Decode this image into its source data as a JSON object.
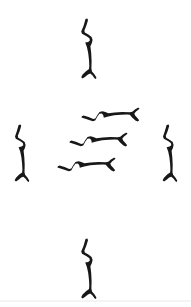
{
  "image": {
    "title": "Twig Stroke Arrangement",
    "width": 191,
    "height": 307,
    "background_color": "#ffffff",
    "ink_color": "#181818",
    "medium": "brush-ink-drawing",
    "description": "Seven forked twig-like brush strokes arranged in a cross pattern around three stacked horizontal strokes"
  },
  "figure": {
    "layout": "cross",
    "stroke_count": 7,
    "center_cluster_count": 3,
    "satellite_count": 4
  },
  "strokes": [
    {
      "name": "top-stroke",
      "orientation": "vertical",
      "position": "top",
      "x": 82,
      "y": 18,
      "length": 62,
      "path": "M 85.5 19 L 83.5 26 L 81.2 31.5 L 82.0 33.8 L 86.6 36.2 L 89.4 38.2 L 89.9 40.6 L 88.2 42.0 L 85.2 42.6 L 86.9 47.0 L 88.2 53.0 L 89.0 60.0 L 89.3 66.0 L 89.0 69.0 L 86.0 71.3 L 82.6 74.6 L 81.2 77.2 L 82.6 78.6 L 85.2 76.8 L 88.0 74.4 L 90.2 73.6 L 92.6 75.6 L 94.4 78.2 L 96.0 79.1 L 96.4 77.4 L 94.4 74.2 L 92.0 71.4 L 91.4 68.6 L 91.6 61.0 L 91.2 53.0 L 90.4 46.2 L 91.8 43.2 L 92.6 40.0 L 91.6 37.0 L 88.4 34.6 L 84.8 32.6 L 84.4 30.4 L 86.4 25.6 L 88.0 20.2 L 87.4 18.4 Z"
    },
    {
      "name": "left-stroke",
      "orientation": "vertical",
      "position": "left",
      "x": 13,
      "y": 124,
      "length": 58,
      "path": "M 18.6 125 L 16.8 131.2 L 15.0 136.4 L 15.8 138.8 L 20.0 141.0 L 22.8 143.0 L 23.3 145.2 L 21.6 146.6 L 18.6 147.2 L 20.2 151.4 L 21.4 157.2 L 22.1 163.8 L 22.4 169.6 L 22.1 172.4 L 19.2 174.6 L 16.0 177.8 L 14.6 180.2 L 16.0 181.6 L 18.6 179.8 L 21.2 177.6 L 23.3 176.8 L 25.6 178.8 L 27.4 181.2 L 28.9 182.0 L 29.2 180.4 L 27.4 177.4 L 25.1 174.8 L 24.5 172.2 L 24.7 164.8 L 24.3 157.2 L 23.6 150.8 L 24.9 147.9 L 25.6 144.9 L 24.7 142.0 L 21.6 139.7 L 18.2 137.8 L 17.8 135.7 L 19.7 131.1 L 21.2 126.0 L 20.6 124.4 Z"
    },
    {
      "name": "right-stroke",
      "orientation": "vertical",
      "position": "right",
      "x": 160,
      "y": 124,
      "length": 58,
      "path": "M 166.6 125 L 164.8 131.2 L 163.0 136.4 L 163.8 138.8 L 168.0 141.0 L 170.8 143.0 L 171.3 145.2 L 169.6 146.6 L 166.6 147.2 L 168.2 151.4 L 169.4 157.2 L 170.1 163.8 L 170.4 169.6 L 170.1 172.4 L 167.2 174.6 L 164.0 177.8 L 162.6 180.2 L 164.0 181.6 L 166.6 179.8 L 169.2 177.6 L 171.3 176.8 L 173.6 178.8 L 175.4 181.2 L 176.9 182.0 L 177.2 180.4 L 175.4 177.4 L 173.1 174.8 L 172.5 172.2 L 172.7 164.8 L 172.3 157.2 L 171.6 150.8 L 172.9 147.9 L 173.6 144.9 L 172.7 142.0 L 169.6 139.7 L 166.2 137.8 L 165.8 135.7 L 167.7 131.1 L 169.2 126.0 L 168.6 124.4 Z"
    },
    {
      "name": "bottom-stroke",
      "orientation": "vertical",
      "position": "bottom",
      "x": 82,
      "y": 238,
      "length": 60,
      "path": "M 85.5 239 L 83.5 246 L 81.2 251.5 L 82.0 253.8 L 86.6 256.2 L 89.4 258.2 L 89.9 260.6 L 88.2 262.0 L 85.2 262.6 L 86.9 267.0 L 88.2 273.0 L 89.0 280.0 L 89.3 286.0 L 89.0 289.0 L 86.0 291.3 L 82.6 294.6 L 81.2 297.2 L 82.6 298.6 L 85.2 296.8 L 88.0 294.4 L 90.2 293.6 L 92.6 295.6 L 94.4 298.2 L 96.0 299.1 L 96.4 297.4 L 94.4 294.2 L 92.0 291.4 L 91.4 288.6 L 91.6 281.0 L 91.2 273.0 L 90.4 266.2 L 91.8 263.2 L 92.6 260.0 L 91.6 257.0 L 88.4 254.6 L 84.8 252.6 L 84.4 250.4 L 86.4 245.6 L 88.0 240.2 L 87.4 238.4 Z"
    },
    {
      "name": "center-stroke-upper",
      "orientation": "horizontal",
      "position": "center-top",
      "x": 80,
      "y": 113,
      "length": 62,
      "path": "M 81.4 117.4 L 87.6 119.4 L 92.8 121.2 L 95.2 120.5 L 97.4 116.4 L 99.4 113.8 L 101.8 113.4 L 103.2 115.0 L 103.8 117.8 L 108.2 116.4 L 114.2 115.3 L 121.0 114.7 L 127.0 114.5 L 129.8 114.8 L 132.1 117.4 L 135.4 120.4 L 137.8 121.6 L 139.2 120.3 L 137.4 117.9 L 135.1 115.5 L 134.3 113.4 L 136.3 111.2 L 138.7 109.5 L 139.5 108.1 L 137.9 107.8 L 134.9 109.5 L 132.3 111.7 L 129.7 112.3 L 122.3 112.1 L 114.7 112.5 L 108.3 113.2 L 105.4 111.9 L 102.4 111.2 L 99.5 112.1 L 97.2 115.2 L 95.3 118.6 L 93.2 119.0 L 88.6 117.1 L 83.5 115.6 L 81.9 116.2 Z"
    },
    {
      "name": "center-stroke-middle",
      "orientation": "horizontal",
      "position": "center-middle",
      "x": 68,
      "y": 134,
      "length": 60,
      "path": "M 69.4 142.4 L 75.6 144.4 L 80.8 146.2 L 83.2 145.5 L 85.4 141.4 L 87.4 138.8 L 89.8 138.4 L 91.2 140.0 L 91.8 142.8 L 96.2 141.4 L 102.2 140.3 L 109.0 139.7 L 115.0 139.5 L 117.8 139.8 L 120.1 142.4 L 123.4 145.4 L 125.8 146.6 L 127.2 145.3 L 125.4 142.9 L 123.1 140.5 L 122.3 138.4 L 124.3 136.2 L 126.7 134.5 L 127.5 133.1 L 125.9 132.8 L 122.9 134.5 L 120.3 136.7 L 117.7 137.3 L 110.3 137.1 L 102.7 137.5 L 96.3 138.2 L 93.4 136.9 L 90.4 136.2 L 87.5 137.1 L 85.2 140.2 L 83.3 143.6 L 81.2 144.0 L 76.6 142.1 L 71.5 140.6 L 69.9 141.2 Z"
    },
    {
      "name": "center-stroke-lower",
      "orientation": "horizontal",
      "position": "center-bottom",
      "x": 56,
      "y": 155,
      "length": 60,
      "path": "M 57.4 167.4 L 63.6 169.4 L 68.8 171.2 L 71.2 170.5 L 73.4 166.4 L 75.4 163.8 L 77.8 163.4 L 79.2 165.0 L 79.8 167.8 L 84.2 166.4 L 90.2 165.3 L 97.0 164.7 L 103.0 164.5 L 105.8 164.8 L 108.1 167.4 L 111.4 170.4 L 113.8 171.6 L 115.2 170.3 L 113.4 167.9 L 111.1 165.5 L 110.3 163.4 L 112.3 161.2 L 114.7 159.5 L 115.5 158.1 L 113.9 157.8 L 110.9 159.5 L 108.3 161.7 L 105.7 162.3 L 98.3 162.1 L 90.7 162.5 L 84.3 163.2 L 81.4 161.9 L 78.4 161.2 L 75.5 162.1 L 73.2 165.2 L 71.3 168.6 L 69.2 169.0 L 64.6 167.1 L 59.5 165.6 L 57.9 166.2 Z"
    }
  ],
  "baseline": {
    "name": "bottom-edge-rule",
    "color": "#f4f4f4",
    "y": 300,
    "height": 2
  }
}
